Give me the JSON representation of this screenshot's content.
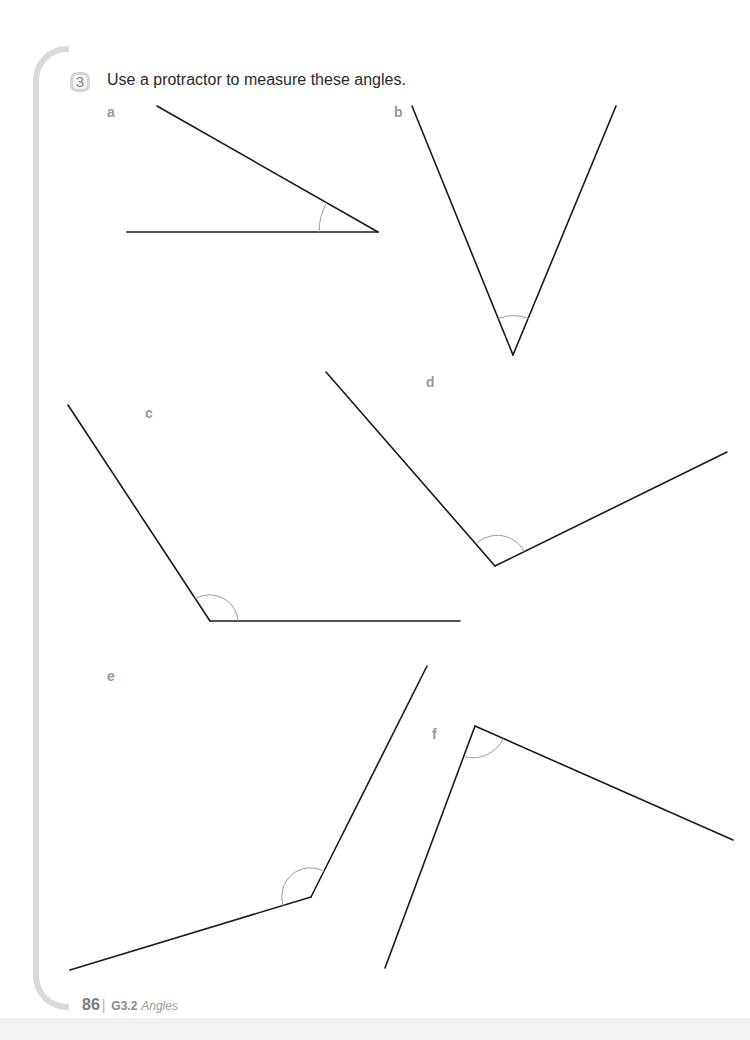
{
  "question": {
    "number": "3",
    "instruction": "Use a protractor to measure these angles."
  },
  "angles": [
    {
      "label": "a",
      "vertex": [
        378,
        232
      ],
      "arm1": [
        157,
        106
      ],
      "arm2": [
        127,
        232
      ]
    },
    {
      "label": "b",
      "vertex": [
        513,
        355
      ],
      "arm1": [
        412,
        106
      ],
      "arm2": [
        616,
        106
      ]
    },
    {
      "label": "c",
      "vertex": [
        210,
        621
      ],
      "arm1": [
        68,
        405
      ],
      "arm2": [
        460,
        621
      ]
    },
    {
      "label": "d",
      "vertex": [
        495,
        566
      ],
      "arm1": [
        326,
        372
      ],
      "arm2": [
        727,
        452
      ]
    },
    {
      "label": "e",
      "vertex": [
        311,
        897
      ],
      "arm1": [
        70,
        970
      ],
      "arm2": [
        427,
        666
      ]
    },
    {
      "label": "f",
      "vertex": [
        475,
        726
      ],
      "arm1": [
        385,
        968
      ],
      "arm2": [
        733,
        840
      ]
    }
  ],
  "footer": {
    "page_number": "86",
    "separator": "|",
    "section_code": "G3.2",
    "section_title": "Angles"
  }
}
